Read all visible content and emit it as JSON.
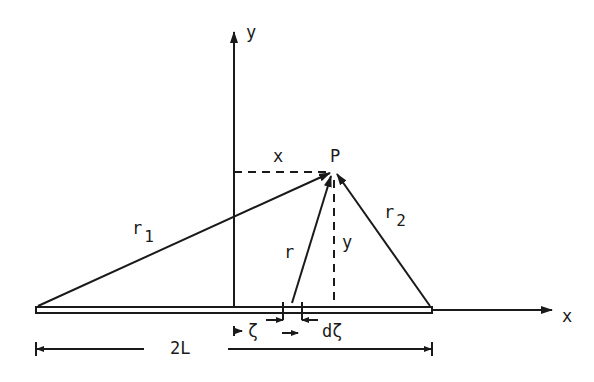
{
  "diagram": {
    "colors": {
      "ink": "#1a1a1a",
      "background": "#ffffff"
    },
    "axes": {
      "y_label": "y",
      "x_label": "x"
    },
    "point": {
      "label": "P"
    },
    "coordinate_labels": {
      "x": "x",
      "y": "y"
    },
    "vectors": {
      "r1": {
        "base": "r",
        "sub": "1"
      },
      "r": {
        "base": "r"
      },
      "r2": {
        "base": "r",
        "sub": "2"
      }
    },
    "element": {
      "position_label": "ζ",
      "width_label": "dζ"
    },
    "dimension": {
      "label": "2L"
    }
  }
}
